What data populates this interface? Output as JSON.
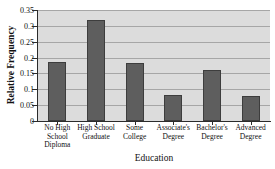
{
  "chart_data": {
    "type": "bar",
    "title": "",
    "xlabel": "Education",
    "ylabel": "Relative Frequency",
    "categories": [
      "No High\nSchool\nDiploma",
      "High School\nGraduate",
      "Some\nCollege",
      "Associate's\nDegree",
      "Bachelor's\nDegree",
      "Advanced\nDegree"
    ],
    "values": [
      0.186,
      0.32,
      0.182,
      0.083,
      0.16,
      0.08
    ],
    "ylim": [
      0,
      0.35
    ],
    "yticks": [
      0,
      0.05,
      0.1,
      0.15,
      0.2,
      0.25,
      0.3,
      0.35
    ],
    "ytick_labels": [
      "0",
      "0.05",
      "0.1",
      "0.15",
      "0.2",
      "0.25",
      "0.3",
      "0.35"
    ],
    "grid": "horizontal",
    "legend": "none",
    "bar_color": "#5e5e5e",
    "plot_background": "#dcdcdc",
    "gridline_color": "#a6a6a6",
    "axis_color": "#2b2b2b"
  }
}
